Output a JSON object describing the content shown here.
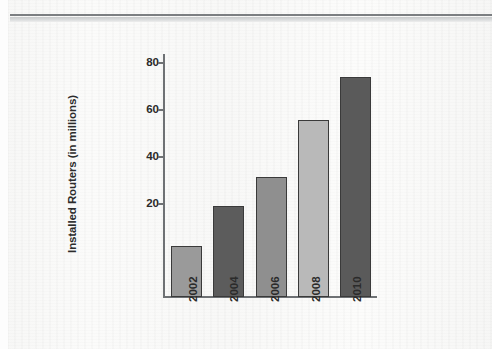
{
  "document": {
    "header_rule": "horizontal-rule"
  },
  "chart_data": {
    "type": "bar",
    "title": "",
    "xlabel": "",
    "ylabel": "Installed Routers (in millions)",
    "categories": [
      "2002",
      "2004",
      "2006",
      "2008",
      "2010"
    ],
    "values": [
      18,
      32,
      42,
      62,
      77
    ],
    "yticks": [
      "20",
      "40",
      "60",
      "80"
    ],
    "ytick_values": [
      20,
      40,
      60,
      80
    ],
    "ylim": [
      0,
      85
    ],
    "grid": false,
    "legend": null,
    "bar_colors": [
      "#9a9a9a",
      "#5c5c5c",
      "#8f8f8f",
      "#b9b9b9",
      "#5a5a5a"
    ],
    "bar_edge_color": "#3a3a3a",
    "axis_color": "#6e7174",
    "text_color": "#2b2b2b",
    "background_color": "#f8f8f7",
    "xtick_rotation": 90
  }
}
